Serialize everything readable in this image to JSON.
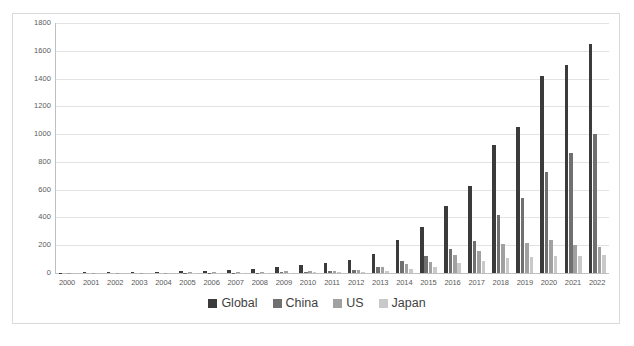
{
  "chart_data": {
    "type": "bar",
    "title": "",
    "subtitle": "",
    "xlabel": "",
    "ylabel": "",
    "ylim": [
      0,
      1800
    ],
    "ytick_step": 200,
    "yticks": [
      1800,
      1600,
      1400,
      1200,
      1000,
      800,
      600,
      400,
      200,
      0
    ],
    "grid": true,
    "legend_position": "bottom",
    "categories": [
      "2000",
      "2001",
      "2002",
      "2003",
      "2004",
      "2005",
      "2006",
      "2007",
      "2008",
      "2009",
      "2010",
      "2011",
      "2012",
      "2013",
      "2014",
      "2015",
      "2016",
      "2017",
      "2018",
      "2019",
      "2020",
      "2021",
      "2022"
    ],
    "series": [
      {
        "name": "Global",
        "color": "#3b3b3b",
        "values": [
          2,
          4,
          6,
          8,
          10,
          13,
          17,
          22,
          30,
          42,
          58,
          72,
          92,
          135,
          235,
          330,
          480,
          630,
          925,
          1050,
          1420,
          1500,
          1650
        ]
      },
      {
        "name": "China",
        "color": "#707070",
        "values": [
          0,
          0,
          0,
          0,
          0,
          1,
          1,
          2,
          3,
          5,
          8,
          12,
          20,
          42,
          85,
          120,
          170,
          230,
          420,
          540,
          725,
          865,
          1000
        ]
      },
      {
        "name": "US",
        "color": "#a1a1a1",
        "values": [
          1,
          1,
          2,
          2,
          3,
          4,
          5,
          6,
          8,
          11,
          14,
          18,
          24,
          40,
          62,
          80,
          130,
          155,
          210,
          215,
          235,
          205,
          190
        ]
      },
      {
        "name": "Japan",
        "color": "#c9c9c9",
        "values": [
          0,
          0,
          0,
          0,
          0,
          1,
          1,
          1,
          2,
          3,
          4,
          5,
          8,
          15,
          30,
          45,
          70,
          85,
          105,
          115,
          120,
          125,
          130
        ]
      }
    ],
    "legend": [
      "Global",
      "China",
      "US",
      "Japan"
    ]
  }
}
